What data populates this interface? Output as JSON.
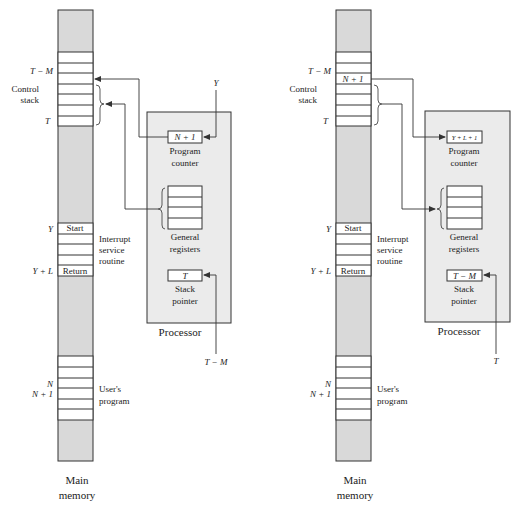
{
  "colors": {
    "memory_fill": "#d9d9d9",
    "processor_fill": "#ebebeb",
    "line": "#333333",
    "cell_fill": "#ffffff"
  },
  "panels": [
    {
      "id": "before",
      "memory": {
        "title_line1": "Main",
        "title_line2": "memory",
        "labels": {
          "t_minus_m": "T − M",
          "control_stack_1": "Control",
          "control_stack_2": "stack",
          "t": "T",
          "y": "Y",
          "y_plus_l": "Y + L",
          "n": "N",
          "n_plus_1": "N + 1"
        },
        "stack_cell_value": "",
        "start_label": "Start",
        "return_label": "Return",
        "isr_label_1": "Interrupt",
        "isr_label_2": "service",
        "isr_label_3": "routine",
        "user_label_1": "User's",
        "user_label_2": "program"
      },
      "processor": {
        "title": "Processor",
        "program_counter_value": "N + 1",
        "program_counter_label_1": "Program",
        "program_counter_label_2": "counter",
        "general_registers_label_1": "General",
        "general_registers_label_2": "registers",
        "stack_pointer_value": "T",
        "stack_pointer_label_1": "Stack",
        "stack_pointer_label_2": "pointer"
      },
      "inputs": {
        "pc_input": "Y",
        "sp_input": "T − M"
      }
    },
    {
      "id": "after",
      "memory": {
        "title_line1": "Main",
        "title_line2": "memory",
        "labels": {
          "t_minus_m": "T − M",
          "control_stack_1": "Control",
          "control_stack_2": "stack",
          "t": "T",
          "y": "Y",
          "y_plus_l": "Y + L",
          "n": "N",
          "n_plus_1": "N + 1"
        },
        "stack_cell_value": "N + 1",
        "start_label": "Start",
        "return_label": "Return",
        "isr_label_1": "Interrupt",
        "isr_label_2": "service",
        "isr_label_3": "routine",
        "user_label_1": "User's",
        "user_label_2": "program"
      },
      "processor": {
        "title": "Processor",
        "program_counter_value": "Y + L + 1",
        "program_counter_label_1": "Program",
        "program_counter_label_2": "counter",
        "general_registers_label_1": "General",
        "general_registers_label_2": "registers",
        "stack_pointer_value": "T − M",
        "stack_pointer_label_1": "Stack",
        "stack_pointer_label_2": "pointer"
      },
      "inputs": {
        "pc_input": "",
        "sp_input": "T"
      }
    }
  ]
}
